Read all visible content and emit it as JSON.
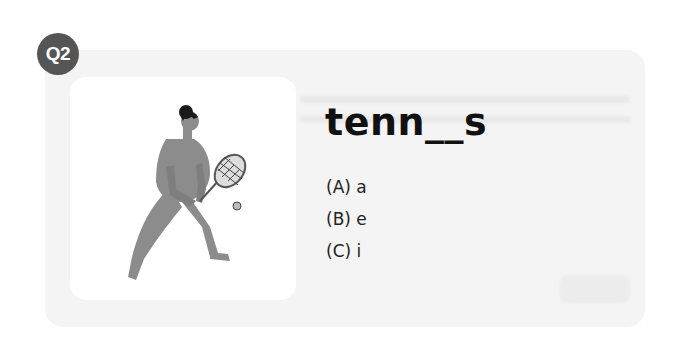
{
  "question": {
    "badge": "Q2",
    "word": "tenn__s",
    "image_subject": "woman-playing-tennis-illustration",
    "options": [
      {
        "label": "(A) a"
      },
      {
        "label": "(B) e"
      },
      {
        "label": "(C) i"
      }
    ]
  },
  "colors": {
    "badge_bg": "#555555",
    "card_bg": "#f4f4f4",
    "figure": "#8c8c8c",
    "hair": "#1a1a1a"
  }
}
